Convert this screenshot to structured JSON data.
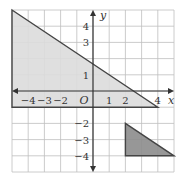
{
  "chart_data": {
    "type": "area",
    "title": "",
    "xlabel": "x",
    "ylabel": "y",
    "origin_label": "O",
    "xlim": [
      -5,
      5
    ],
    "ylim": [
      -5,
      5
    ],
    "grid": true,
    "x_ticks": [
      {
        "value": -4,
        "label": "−4"
      },
      {
        "value": -3,
        "label": "−3"
      },
      {
        "value": -2,
        "label": "−2"
      },
      {
        "value": 1,
        "label": "1"
      },
      {
        "value": 2,
        "label": "2"
      },
      {
        "value": 4,
        "label": "4"
      }
    ],
    "y_ticks": [
      {
        "value": 4,
        "label": "4"
      },
      {
        "value": 3,
        "label": "3"
      },
      {
        "value": 1,
        "label": "1"
      },
      {
        "value": -2,
        "label": "−2"
      },
      {
        "value": -3,
        "label": "−3"
      },
      {
        "value": -4,
        "label": "−4"
      }
    ],
    "series": [
      {
        "name": "light-shaded-region",
        "color": "#dcdcdc",
        "boundary_line": {
          "x1": -5,
          "y1": 5,
          "x2": 4,
          "y2": -1,
          "equation": "y = -2/3 x + 5/3"
        },
        "vertices": [
          [
            -5,
            5
          ],
          [
            4,
            -1
          ],
          [
            -5,
            -1
          ]
        ]
      },
      {
        "name": "dark-shaded-triangle",
        "color": "#8c8c8c",
        "vertices": [
          [
            2,
            -2
          ],
          [
            5,
            -4
          ],
          [
            2,
            -4
          ]
        ]
      }
    ]
  }
}
